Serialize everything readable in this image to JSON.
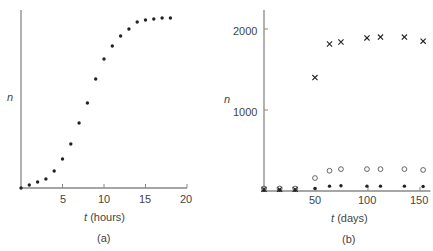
{
  "chart_data": [
    {
      "type": "scatter",
      "panel": "(a)",
      "xlabel_var": "t",
      "xlabel_unit": "(hours)",
      "ylabel": "n",
      "xlim": [
        0,
        20
      ],
      "x_ticks": [
        5,
        10,
        15,
        20
      ],
      "y_ticks": [],
      "series": [
        {
          "name": "n",
          "marker": "dot",
          "x": [
            0,
            1,
            2,
            3,
            4,
            5,
            6,
            7,
            8,
            9,
            10,
            11,
            12,
            13,
            14,
            15,
            16,
            17,
            18
          ],
          "y_px_height": [
            0,
            3,
            6,
            9,
            17,
            29,
            44,
            65,
            85,
            109,
            129,
            142,
            152,
            159,
            166,
            168,
            169,
            170,
            170
          ],
          "y_rel": [
            0.0,
            0.018,
            0.035,
            0.053,
            0.1,
            0.17,
            0.26,
            0.38,
            0.5,
            0.64,
            0.76,
            0.84,
            0.89,
            0.94,
            0.98,
            0.99,
            0.99,
            1.0,
            1.0
          ]
        }
      ]
    },
    {
      "type": "scatter",
      "panel": "(b)",
      "xlabel_var": "t",
      "xlabel_unit": "(days)",
      "ylabel": "n",
      "xlim": [
        0,
        160
      ],
      "ylim": [
        0,
        2350
      ],
      "x_ticks": [
        50,
        100,
        150
      ],
      "y_ticks": [
        1000,
        2000
      ],
      "series": [
        {
          "name": "crosses",
          "marker": "x",
          "x": [
            0,
            15,
            30,
            49,
            63,
            74,
            99,
            112,
            135,
            153
          ],
          "y": [
            20,
            20,
            20,
            1400,
            1815,
            1840,
            1890,
            1900,
            1900,
            1850
          ]
        },
        {
          "name": "open circles",
          "marker": "o",
          "x": [
            0,
            15,
            30,
            49,
            63,
            74,
            99,
            112,
            135,
            153
          ],
          "y": [
            30,
            30,
            30,
            160,
            250,
            270,
            270,
            270,
            270,
            260
          ]
        },
        {
          "name": "filled dots",
          "marker": "dot",
          "x": [
            0,
            15,
            30,
            49,
            63,
            74,
            99,
            112,
            135,
            153
          ],
          "y": [
            10,
            10,
            10,
            30,
            60,
            65,
            60,
            60,
            60,
            55
          ]
        }
      ]
    }
  ],
  "labels": {
    "a": {
      "ylabel": "n",
      "xvar": "t",
      "xunit": "(hours)",
      "panel": "(a)",
      "ticks": [
        "5",
        "10",
        "15",
        "20"
      ]
    },
    "b": {
      "ylabel": "n",
      "xvar": "t",
      "xunit": "(days)",
      "panel": "(b)",
      "xticks": [
        "50",
        "100",
        "150"
      ],
      "yticks": [
        "1000",
        "2000"
      ]
    }
  }
}
